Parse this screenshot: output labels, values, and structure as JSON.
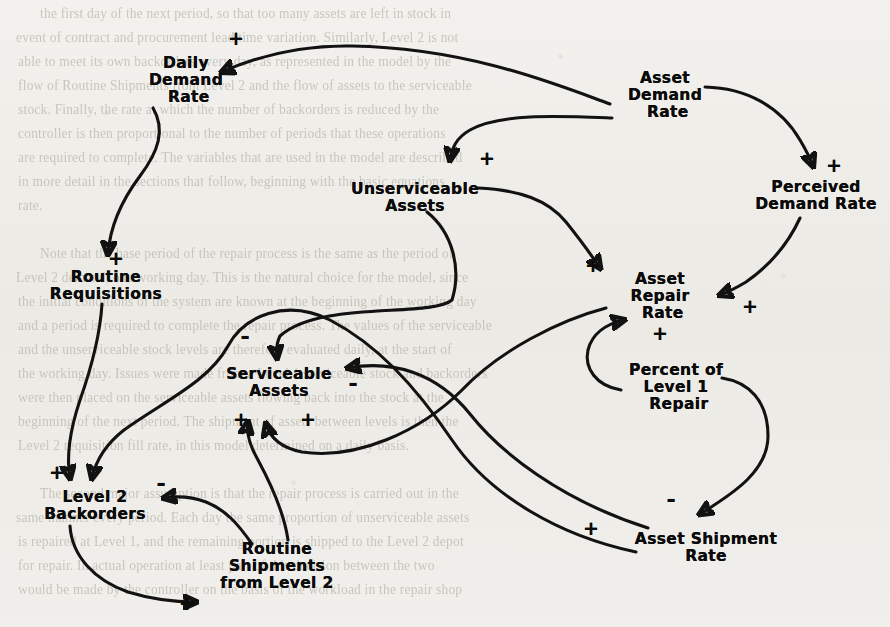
{
  "page": {
    "kind": "causal-loop-diagram",
    "background_color": "#eeedE9",
    "ink_color": "#0b0b0b",
    "ghost_text_color": "#b9b5ab"
  },
  "diagram": {
    "nodes": [
      {
        "id": "daily-demand-rate",
        "label": "Daily\nDemand\n Rate",
        "x": 186,
        "y": 80
      },
      {
        "id": "asset-demand-rate",
        "label": "Asset\nDemand\n Rate",
        "x": 665,
        "y": 95
      },
      {
        "id": "perceived-demand-rate",
        "label": "Perceived\nDemand Rate",
        "x": 816,
        "y": 196
      },
      {
        "id": "unserviceable-assets",
        "label": "Unserviceable\nAssets",
        "x": 415,
        "y": 198
      },
      {
        "id": "routine-requisitions",
        "label": "Routine\nRequisitions",
        "x": 106,
        "y": 286
      },
      {
        "id": "asset-repair-rate",
        "label": "Asset\nRepair\n Rate",
        "x": 660,
        "y": 296
      },
      {
        "id": "serviceable-assets",
        "label": "Serviceable\nAssets",
        "x": 279,
        "y": 383
      },
      {
        "id": "percent-of-level-1-repair",
        "label": "Percent of\nLevel 1\n Repair",
        "x": 676,
        "y": 387
      },
      {
        "id": "level-2-backorders",
        "label": "Level 2\nBackorders",
        "x": 95,
        "y": 506
      },
      {
        "id": "routine-shipments-from-level-2",
        "label": "Routine\nShipments\nfrom Level 2",
        "x": 277,
        "y": 566
      },
      {
        "id": "asset-shipment-rate",
        "label": "Asset Shipment\nRate",
        "x": 706,
        "y": 548
      }
    ],
    "polarity_marks": [
      {
        "id": "plus-daily-demand-rate",
        "sign": "+",
        "x": 236,
        "y": 38
      },
      {
        "id": "plus-unserviceable-assets",
        "sign": "+",
        "x": 487,
        "y": 158
      },
      {
        "id": "plus-perceived-demand-rate",
        "sign": "+",
        "x": 834,
        "y": 165
      },
      {
        "id": "plus-routine-requisitions",
        "sign": "+",
        "x": 116,
        "y": 258
      },
      {
        "id": "plus-asset-repair-rate-from-unserviceable",
        "sign": "+",
        "x": 593,
        "y": 265
      },
      {
        "id": "plus-asset-repair-rate-from-perceived",
        "sign": "+",
        "x": 750,
        "y": 306
      },
      {
        "id": "plus-asset-repair-rate-from-percent",
        "sign": "+",
        "x": 660,
        "y": 333
      },
      {
        "id": "minus-serviceable-assets-top",
        "sign": "-",
        "x": 245,
        "y": 336
      },
      {
        "id": "minus-serviceable-assets-right",
        "sign": "-",
        "x": 353,
        "y": 383
      },
      {
        "id": "plus-serviceable-assets-left",
        "sign": "+",
        "x": 241,
        "y": 419
      },
      {
        "id": "plus-serviceable-assets-right",
        "sign": "+",
        "x": 308,
        "y": 419
      },
      {
        "id": "plus-level-2-backorders",
        "sign": "+",
        "x": 57,
        "y": 472
      },
      {
        "id": "minus-level-2-backorders",
        "sign": "-",
        "x": 161,
        "y": 483
      },
      {
        "id": "minus-asset-shipment-rate",
        "sign": "-",
        "x": 671,
        "y": 499
      },
      {
        "id": "plus-asset-shipment-rate",
        "sign": "+",
        "x": 591,
        "y": 528
      },
      {
        "id": "plus-routine-shipments",
        "sign": "+",
        "x": 187,
        "y": 603
      }
    ],
    "links": [
      {
        "id": "asset-demand-rate-to-daily-demand-rate",
        "from": "asset-demand-rate",
        "to": "daily-demand-rate",
        "polarity": "+"
      },
      {
        "id": "asset-demand-rate-to-unserviceable-assets",
        "from": "asset-demand-rate",
        "to": "unserviceable-assets",
        "polarity": "+"
      },
      {
        "id": "asset-demand-rate-to-perceived-demand-rate",
        "from": "asset-demand-rate",
        "to": "perceived-demand-rate",
        "polarity": "+"
      },
      {
        "id": "daily-demand-rate-to-routine-requisitions",
        "from": "daily-demand-rate",
        "to": "routine-requisitions",
        "polarity": "+"
      },
      {
        "id": "unserviceable-assets-to-asset-repair-rate",
        "from": "unserviceable-assets",
        "to": "asset-repair-rate",
        "polarity": "+"
      },
      {
        "id": "unserviceable-assets-to-serviceable-assets",
        "from": "unserviceable-assets",
        "to": "serviceable-assets",
        "polarity": "-"
      },
      {
        "id": "perceived-demand-rate-to-asset-repair-rate",
        "from": "perceived-demand-rate",
        "to": "asset-repair-rate",
        "polarity": "+"
      },
      {
        "id": "percent-of-level-1-repair-to-asset-repair-rate",
        "from": "percent-of-level-1-repair",
        "to": "asset-repair-rate",
        "polarity": "+"
      },
      {
        "id": "percent-of-level-1-repair-to-asset-shipment-rate",
        "from": "percent-of-level-1-repair",
        "to": "asset-shipment-rate",
        "polarity": "-"
      },
      {
        "id": "asset-repair-rate-to-serviceable-assets",
        "from": "asset-repair-rate",
        "to": "serviceable-assets",
        "polarity": "+"
      },
      {
        "id": "asset-shipment-rate-to-serviceable-assets",
        "from": "asset-shipment-rate",
        "to": "serviceable-assets",
        "polarity": "-"
      },
      {
        "id": "asset-shipment-rate-to-level-2-backorders",
        "from": "asset-shipment-rate",
        "to": "level-2-backorders",
        "polarity": "+"
      },
      {
        "id": "routine-requisitions-to-level-2-backorders",
        "from": "routine-requisitions",
        "to": "level-2-backorders",
        "polarity": "+"
      },
      {
        "id": "routine-shipments-to-level-2-backorders",
        "from": "routine-shipments-from-level-2",
        "to": "level-2-backorders",
        "polarity": "-"
      },
      {
        "id": "routine-shipments-to-serviceable-assets",
        "from": "routine-shipments-from-level-2",
        "to": "serviceable-assets",
        "polarity": "+"
      },
      {
        "id": "level-2-backorders-to-routine-shipments",
        "from": "level-2-backorders",
        "to": "routine-shipments-from-level-2",
        "polarity": "+"
      }
    ]
  },
  "bleed_through_lines": [
    {
      "x": 40,
      "y": 6,
      "text": "the first day of the next period, so that too many assets are left in stock in"
    },
    {
      "x": 16,
      "y": 30,
      "text": "event of contract and procurement lead time variation. Similarly, Level 2 is not"
    },
    {
      "x": 18,
      "y": 54,
      "text": "able to meet its own backorders every day, as represented in the model by the"
    },
    {
      "x": 18,
      "y": 78,
      "text": "flow of Routine Shipments from Level 2 and the flow of assets to the serviceable"
    },
    {
      "x": 18,
      "y": 102,
      "text": "stock. Finally, the rate at which the number of backorders is reduced by the"
    },
    {
      "x": 18,
      "y": 126,
      "text": "controller is then proportional to the number of periods that these operations"
    },
    {
      "x": 18,
      "y": 150,
      "text": "are required to complete. The variables that are used in the model are described"
    },
    {
      "x": 18,
      "y": 174,
      "text": "in more detail in the sections that follow, beginning with the basic equations"
    },
    {
      "x": 18,
      "y": 198,
      "text": "rate."
    },
    {
      "x": 40,
      "y": 246,
      "text": "Note that the base period of the repair process is the same as the period of"
    },
    {
      "x": 16,
      "y": 270,
      "text": "Level 2 demand, one working day. This is the natural choice for the model, since"
    },
    {
      "x": 18,
      "y": 294,
      "text": "the initial conditions of the system are known at the beginning of the working day"
    },
    {
      "x": 18,
      "y": 318,
      "text": "and a period is required to complete the repair process. The values of the serviceable"
    },
    {
      "x": 18,
      "y": 342,
      "text": "and the unserviceable stock levels are therefore evaluated daily, at the start of"
    },
    {
      "x": 18,
      "y": 366,
      "text": "the working day. Issues were made from a Level 1 serviceable stock and backorders"
    },
    {
      "x": 18,
      "y": 390,
      "text": "were then placed on the serviceable assets flowing back into the stock at the"
    },
    {
      "x": 18,
      "y": 414,
      "text": "beginning of the next period. The shipment of assets between levels is then the"
    },
    {
      "x": 18,
      "y": 438,
      "text": "Level 2 requisition fill rate, in this model determined on a daily basis."
    },
    {
      "x": 40,
      "y": 486,
      "text": "The second major assumption is that the repair process is carried out in the"
    },
    {
      "x": 16,
      "y": 510,
      "text": "same manner every period. Each day the same proportion of unserviceable assets"
    },
    {
      "x": 18,
      "y": 534,
      "text": "is repaired at Level 1, and the remaining portion is shipped to the Level 2 depot"
    },
    {
      "x": 18,
      "y": 558,
      "text": "for repair. In actual operation at least part of this decision between the two"
    },
    {
      "x": 18,
      "y": 582,
      "text": "would be made by the controller on the basis of the workload in the repair shop"
    }
  ]
}
